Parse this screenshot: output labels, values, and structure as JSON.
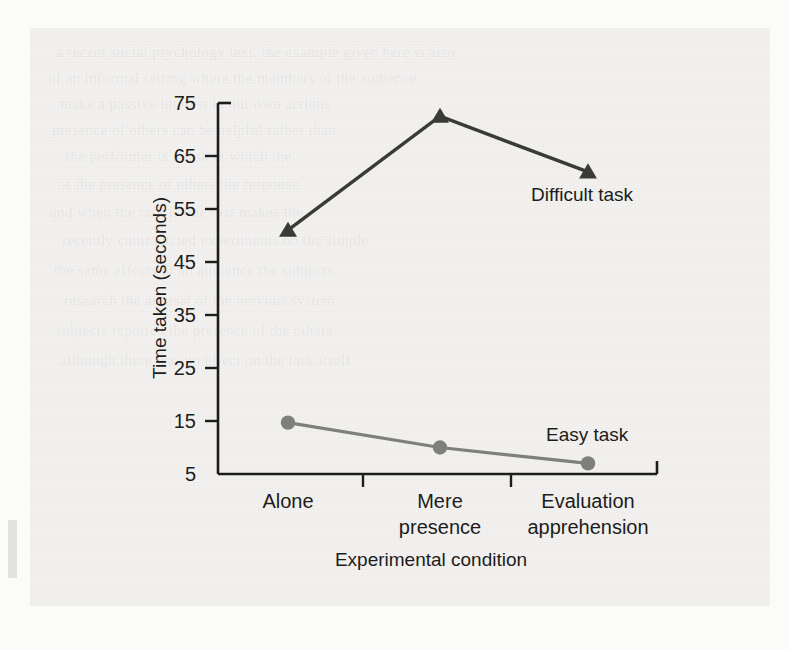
{
  "figure": {
    "background_color": "#f2f1ef",
    "bleed_through_lines": [
      "a recent social psychology text, the example given here is also",
      "of an informal setting where the members of the audience",
      "make a passive interest in our own actions",
      "presence of others can be helpful rather than",
      "the performer is a task at which the",
      "of the presence of others the response",
      "and when the task is one that makes the",
      "recently contradicted experiments on the simple",
      "the same effects of an audience the subjects",
      "research the arousal of the nervous system",
      "subjects reported the presence of the others",
      "although there was no effect on the task itself"
    ]
  },
  "chart_data": {
    "type": "line",
    "title": "",
    "xlabel": "Experimental condition",
    "ylabel": "Time taken (seconds)",
    "categories": [
      "Alone",
      "Mere presence",
      "Evaluation apprehension"
    ],
    "category_lines": [
      [
        "Alone"
      ],
      [
        "Mere",
        "presence"
      ],
      [
        "Evaluation",
        "apprehension"
      ]
    ],
    "ylim": [
      5,
      75
    ],
    "yticks": [
      5,
      15,
      25,
      35,
      45,
      55,
      65,
      75
    ],
    "ytick_labels": [
      "5",
      "15",
      "25",
      "35",
      "45",
      "55",
      "65",
      "75"
    ],
    "grid": false,
    "legend_position": "inline-annotation",
    "series": [
      {
        "name": "Difficult task",
        "label": "Difficult task",
        "marker": "triangle",
        "color": "#3a3a38",
        "values": [
          51,
          72.5,
          62
        ]
      },
      {
        "name": "Easy task",
        "label": "Easy task",
        "marker": "circle",
        "color": "#7f7f7d",
        "values": [
          14.7,
          10,
          7
        ]
      }
    ]
  }
}
